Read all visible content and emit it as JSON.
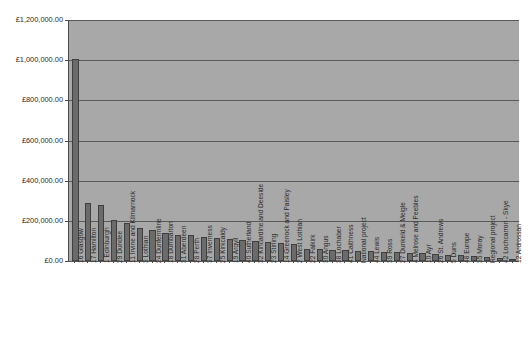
{
  "chart_data": {
    "type": "bar",
    "title": "",
    "subtitle": "",
    "xlabel": "",
    "ylabel": "",
    "ylim": [
      0,
      1200000
    ],
    "ytick_step": 200000,
    "grid": true,
    "legend": "none",
    "currency_symbol": "£",
    "ytick_labels": [
      "£1,200,000.00",
      "£1,000,000.00",
      "£800,000.00",
      "£600,000.00",
      "£400,000.00",
      "£200,000.00",
      "£0.00"
    ],
    "ytick_values": [
      1200000,
      1000000,
      800000,
      600000,
      400000,
      200000,
      0
    ],
    "categories": [
      "16 Glasgow",
      "17 Hamilton",
      "1 Edinburgh",
      "29 Dundee",
      "11 Irvine and Kilmarnock",
      "3 Lothian",
      "24 Dunfermline",
      "18 Dumbarton",
      "31 Aberdeen",
      "28 Perth",
      "37 Inverness",
      "25 Kirkcaldy",
      "19 Argyll",
      "40 Sutherland",
      "32 Kincardine and Deeside",
      "23 Stirling",
      "14 Greenock and Paisley",
      "2 West Lothian",
      "22 Falkirk",
      "30 Angus",
      "38 Lochaber",
      "41 Caithness",
      "National project",
      "44 Lewis",
      "39 Ross",
      "27 Dunkeld & Meigle",
      "4 Melrose and Peebles",
      "10 Ayr",
      "26 St. Andrews",
      "5 Duns",
      "48 Europe",
      "35 Moray",
      "Regional project",
      "42 Lochcarron - Skye",
      "12 Ardrossan"
    ],
    "values": [
      1005000,
      288000,
      281000,
      205000,
      190000,
      163000,
      156000,
      140000,
      132000,
      128000,
      122000,
      116000,
      110000,
      104000,
      100000,
      94000,
      90000,
      84000,
      62000,
      58000,
      56000,
      54000,
      52000,
      49000,
      46000,
      43000,
      41000,
      38000,
      34000,
      31000,
      28000,
      25000,
      21000,
      17000,
      10000
    ]
  },
  "colors": {
    "plot_background": "#a8a8a8",
    "bar_fill": "#6b6b6b",
    "bar_border": "#3f3f3f",
    "gridline": "#5a5a5a",
    "axis": "#4a4a4a",
    "page_background": "#ffffff",
    "text": "#2b2b2b"
  }
}
